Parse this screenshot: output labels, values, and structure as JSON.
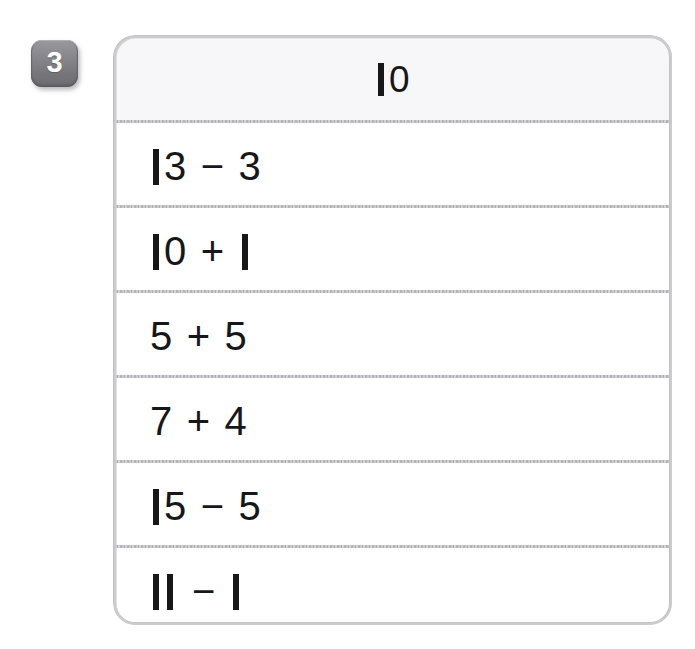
{
  "worksheet": {
    "question_number": "3",
    "card": {
      "header": {
        "target_value": "10"
      },
      "rows": [
        {
          "expression": "13 − 3",
          "left_operand": "13",
          "operator": "−",
          "right_operand": "3",
          "result": 10
        },
        {
          "expression": "10 + 1",
          "left_operand": "10",
          "operator": "+",
          "right_operand": "1",
          "result": 11
        },
        {
          "expression": "5 + 5",
          "left_operand": "5",
          "operator": "+",
          "right_operand": "5",
          "result": 10
        },
        {
          "expression": "7 + 4",
          "left_operand": "7",
          "operator": "+",
          "right_operand": "4",
          "result": 11
        },
        {
          "expression": "15 − 5",
          "left_operand": "15",
          "operator": "−",
          "right_operand": "5",
          "result": 10
        },
        {
          "expression": "11 − 1",
          "left_operand": "11",
          "operator": "−",
          "right_operand": "1",
          "result": 10
        }
      ]
    }
  },
  "colors": {
    "badge_gray": "#87878b",
    "badge_text": "#ffffff",
    "card_border": "#b9b9bd",
    "divider": "#b0b0b5",
    "header_fill": "#f7f7f9",
    "row_fill": "#ffffff",
    "text": "#17171a",
    "page_background": "#ffffff"
  }
}
